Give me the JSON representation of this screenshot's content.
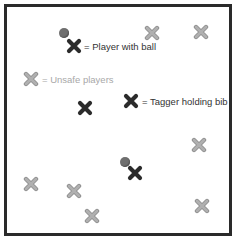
{
  "diagram": {
    "colors": {
      "border": "#2a2a2a",
      "tagger": "#2b2b2b",
      "unsafe": "#a9a9a9",
      "ball": "#6f6f6f",
      "label_dark": "#333333",
      "label_light": "#a8a8a8"
    },
    "legend": [
      {
        "marker": "tagger-x-icon",
        "label": "= Player with ball",
        "has_ball": true
      },
      {
        "marker": "unsafe-x-icon",
        "label": "= Unsafe players"
      },
      {
        "marker": "tagger-x-icon",
        "label": "= Tagger holding bib"
      }
    ],
    "players": {
      "player_with_ball": [
        {
          "x": 74,
          "y": 46,
          "ball_x": 64,
          "ball_y": 33
        },
        {
          "x": 135,
          "y": 173,
          "ball_x": 125,
          "ball_y": 162
        }
      ],
      "taggers": [
        {
          "x": 131,
          "y": 101
        },
        {
          "x": 85,
          "y": 108
        }
      ],
      "unsafe": [
        {
          "x": 152,
          "y": 33
        },
        {
          "x": 201,
          "y": 32
        },
        {
          "x": 31,
          "y": 79
        },
        {
          "x": 199,
          "y": 145
        },
        {
          "x": 31,
          "y": 184
        },
        {
          "x": 74,
          "y": 191
        },
        {
          "x": 92,
          "y": 216
        },
        {
          "x": 202,
          "y": 206
        }
      ]
    }
  }
}
